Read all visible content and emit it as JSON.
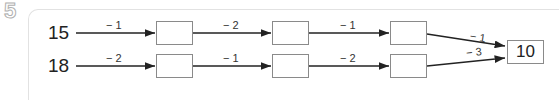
{
  "question_number": "5",
  "rows": [
    {
      "start": "15",
      "steps": [
        "− 1",
        "− 2",
        "− 1",
        "− 1"
      ]
    },
    {
      "start": "18",
      "steps": [
        "− 2",
        "− 1",
        "− 2",
        "− 3"
      ]
    }
  ],
  "result": "10",
  "colors": {
    "line": "#222222",
    "box_border": "#8a8a8a",
    "panel_border": "#e2e2e2"
  }
}
